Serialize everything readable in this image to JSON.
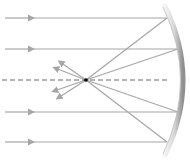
{
  "diagram": {
    "colors": {
      "ray": "#a6a6a6",
      "axis": "#6b6b6b",
      "focus": "#000000",
      "mirror_light": "#f2f2f2",
      "mirror_dark": "#9a9a9a",
      "background": "#ffffff"
    },
    "principal_axis": {
      "y": 80,
      "x_start": 2,
      "x_end": 168,
      "style": "dashed"
    },
    "focal_point": {
      "x": 86,
      "y": 80
    },
    "mirror": {
      "type": "concave",
      "top": [
        165,
        6
      ],
      "apex": [
        183,
        80
      ],
      "bottom": [
        165,
        155
      ]
    },
    "incident_rays": [
      {
        "y": 18,
        "hit_x": 167
      },
      {
        "y": 49,
        "hit_x": 178
      },
      {
        "y": 112,
        "hit_x": 178
      },
      {
        "y": 142,
        "hit_x": 167
      }
    ],
    "reflected_rays_end": [
      {
        "x": 58,
        "y": 98
      },
      {
        "x": 54,
        "y": 91
      },
      {
        "x": 55,
        "y": 68
      },
      {
        "x": 60,
        "y": 62
      }
    ]
  }
}
